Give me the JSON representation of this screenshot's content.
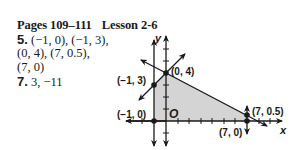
{
  "header": {
    "pages": "Pages 109–111",
    "lesson": "Lesson 2-6"
  },
  "answers": [
    {
      "number": "5.",
      "lines": [
        "(−1, 0), (−1, 3),",
        "(0, 4), (7, 0.5),",
        "(7, 0)"
      ]
    },
    {
      "number": "7.",
      "lines": [
        "3, −11"
      ]
    }
  ],
  "graph": {
    "x_axis_label": "x",
    "y_axis_label": "y",
    "origin_label": "O",
    "vertices": [
      {
        "label": "(−1, 0)",
        "x": -1,
        "y": 0
      },
      {
        "label": "(−1, 3)",
        "x": -1,
        "y": 3
      },
      {
        "label": "(0, 4)",
        "x": 0,
        "y": 4
      },
      {
        "label": "(7, 0.5)",
        "x": 7,
        "y": 0.5
      },
      {
        "label": "(7, 0)",
        "x": 7,
        "y": 0
      }
    ],
    "colors": {
      "shade": "#d4d4d4",
      "line": "#1a1a1a"
    }
  }
}
